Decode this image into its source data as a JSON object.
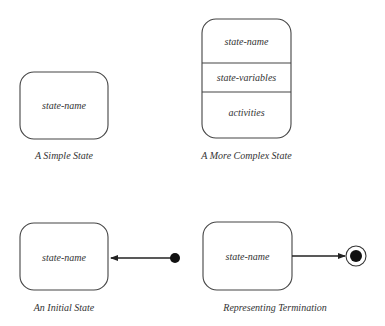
{
  "diagrams": {
    "simple": {
      "state_name": "state-name",
      "caption": "A Simple State"
    },
    "complex": {
      "state_name": "state-name",
      "state_variables": "state-variables",
      "activities": "activities",
      "caption": "A More Complex State"
    },
    "initial": {
      "state_name": "state-name",
      "caption": "An Initial State",
      "icons": [
        "initial-pseudostate-dot-icon",
        "arrow-left-icon"
      ]
    },
    "termination": {
      "state_name": "state-name",
      "caption": "Representing Termination",
      "icons": [
        "arrow-right-icon",
        "final-state-bullseye-icon"
      ]
    }
  },
  "colors": {
    "stroke": "#444444",
    "text": "#333333",
    "fill_dot": "#111111",
    "background": "#ffffff"
  }
}
